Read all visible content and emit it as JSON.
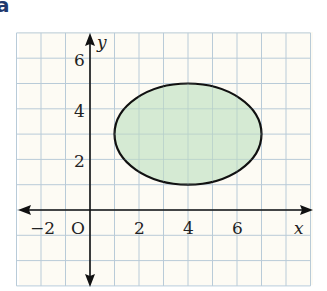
{
  "part_label": "a",
  "axes": {
    "x_label": "x",
    "y_label": "y",
    "origin_label": "O",
    "x_tick_labels": [
      {
        "value": -2,
        "text": "−2"
      },
      {
        "value": 2,
        "text": "2"
      },
      {
        "value": 4,
        "text": "4"
      },
      {
        "value": 6,
        "text": "6"
      }
    ],
    "y_tick_labels": [
      {
        "value": 2,
        "text": "2"
      },
      {
        "value": 4,
        "text": "4"
      },
      {
        "value": 6,
        "text": "6"
      }
    ],
    "x_range": [
      -3,
      9
    ],
    "y_range": [
      -3,
      7
    ],
    "grid": true
  },
  "shape": {
    "type": "ellipse",
    "center": [
      4,
      3
    ],
    "semi_axis_x": 3,
    "semi_axis_y": 2,
    "fill": "#cfe6cc",
    "stroke": "#111111"
  },
  "colors": {
    "paper": "#fdfbf4",
    "grid": "#b9cbd8",
    "axis": "#111111",
    "part_label": "#1f3a6e"
  }
}
